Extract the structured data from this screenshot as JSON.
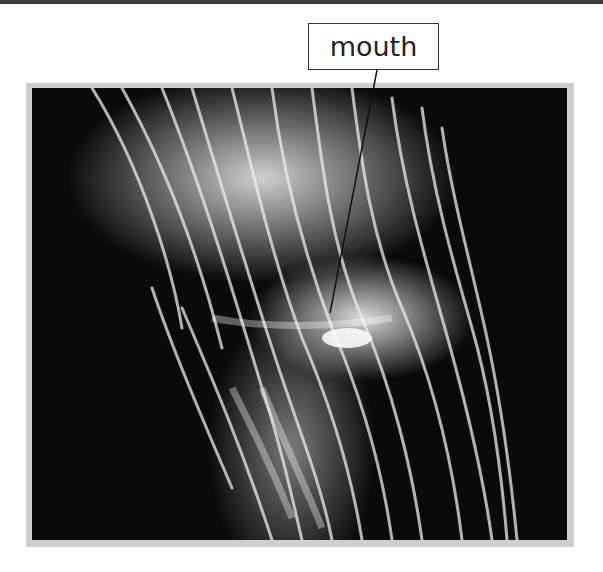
{
  "figure": {
    "labels": [
      {
        "text": "mouth",
        "target": "mouth of jellyfish"
      }
    ]
  },
  "colors": {
    "frame": "#cfcfcf",
    "background": "#ffffff",
    "label_border": "#333333",
    "photo_background": "#0a0a0a"
  }
}
